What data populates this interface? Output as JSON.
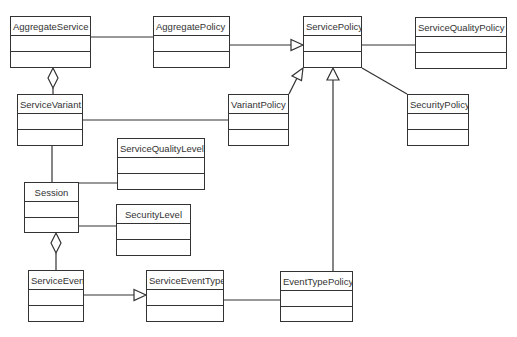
{
  "diagram": {
    "type": "UML class diagram",
    "classes": [
      {
        "id": "aggregate_service",
        "name": "AggregateService",
        "x": 10,
        "y": 16,
        "w": 81,
        "h": 52
      },
      {
        "id": "aggregate_policy",
        "name": "AggregatePolicy",
        "x": 153,
        "y": 16,
        "w": 77,
        "h": 52
      },
      {
        "id": "service_policy",
        "name": "ServicePolicy",
        "x": 303,
        "y": 16,
        "w": 59,
        "h": 52
      },
      {
        "id": "service_quality_policy",
        "name": "ServiceQualityPolicy",
        "x": 415,
        "y": 17,
        "w": 92,
        "h": 52
      },
      {
        "id": "service_variant",
        "name": "ServiceVariant",
        "x": 17,
        "y": 94,
        "w": 66,
        "h": 52
      },
      {
        "id": "variant_policy",
        "name": "VariantPolicy",
        "x": 228,
        "y": 94,
        "w": 61,
        "h": 52
      },
      {
        "id": "security_policy",
        "name": "SecurityPolicy",
        "x": 407,
        "y": 94,
        "w": 62,
        "h": 52
      },
      {
        "id": "service_quality_level",
        "name": "ServiceQualityLevel",
        "x": 117,
        "y": 138,
        "w": 88,
        "h": 52
      },
      {
        "id": "session",
        "name": "Session",
        "x": 24,
        "y": 182,
        "w": 55,
        "h": 51
      },
      {
        "id": "security_level",
        "name": "SecurityLevel",
        "x": 116,
        "y": 204,
        "w": 75,
        "h": 52
      },
      {
        "id": "service_event",
        "name": "ServiceEvent",
        "x": 28,
        "y": 270,
        "w": 56,
        "h": 52
      },
      {
        "id": "service_event_type",
        "name": "ServiceEventType",
        "x": 146,
        "y": 270,
        "w": 78,
        "h": 52
      },
      {
        "id": "event_type_policy",
        "name": "EventTypePolicy",
        "x": 280,
        "y": 271,
        "w": 73,
        "h": 51
      }
    ],
    "relationships": [
      {
        "type": "association",
        "from": "AggregateService",
        "to": "AggregatePolicy"
      },
      {
        "type": "generalization",
        "from": "AggregatePolicy",
        "to": "ServicePolicy"
      },
      {
        "type": "association",
        "from": "ServicePolicy",
        "to": "ServiceQualityPolicy"
      },
      {
        "type": "association",
        "from": "ServicePolicy",
        "to": "SecurityPolicy"
      },
      {
        "type": "generalization",
        "from": "VariantPolicy",
        "to": "ServicePolicy"
      },
      {
        "type": "generalization",
        "from": "EventTypePolicy",
        "to": "ServicePolicy"
      },
      {
        "type": "aggregation",
        "from": "ServiceVariant",
        "to": "AggregateService"
      },
      {
        "type": "association",
        "from": "ServiceVariant",
        "to": "VariantPolicy"
      },
      {
        "type": "association",
        "from": "ServiceVariant",
        "to": "Session"
      },
      {
        "type": "association",
        "from": "Session",
        "to": "ServiceQualityLevel"
      },
      {
        "type": "association",
        "from": "Session",
        "to": "SecurityLevel"
      },
      {
        "type": "aggregation",
        "from": "ServiceEvent",
        "to": "Session"
      },
      {
        "type": "generalization",
        "from": "ServiceEvent",
        "to": "ServiceEventType"
      },
      {
        "type": "association",
        "from": "ServiceEventType",
        "to": "EventTypePolicy"
      }
    ]
  },
  "labels": {
    "aggregate_service": "AggregateService",
    "aggregate_policy": "AggregatePolicy",
    "service_policy": "ServicePolicy",
    "service_quality_policy": "ServiceQualityPolicy",
    "service_variant": "ServiceVariant",
    "variant_policy": "VariantPolicy",
    "security_policy": "SecurityPolicy",
    "service_quality_level": "ServiceQualityLevel",
    "session": "Session",
    "security_level": "SecurityLevel",
    "service_event": "ServiceEvent",
    "service_event_type": "ServiceEventType",
    "event_type_policy": "EventTypePolicy"
  },
  "colors": {
    "line": "#333333",
    "background": "#ffffff"
  }
}
